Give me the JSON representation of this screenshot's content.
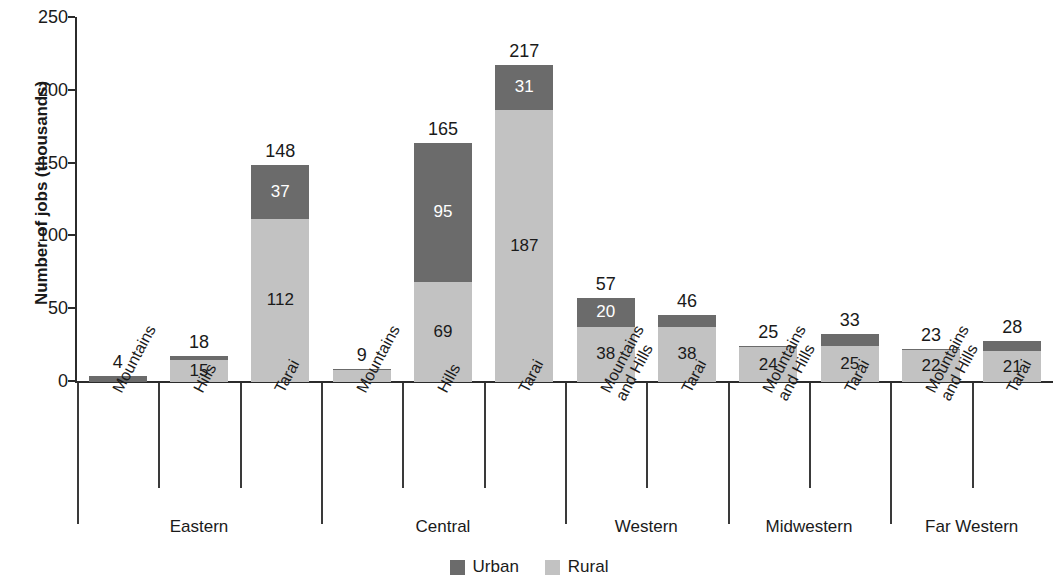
{
  "chart_data": {
    "type": "bar",
    "subtype": "stacked-bar-grouped",
    "title": "",
    "xlabel": "",
    "ylabel": "Number of jobs (thousands)",
    "ylim": [
      0,
      250
    ],
    "yticks": [
      0,
      50,
      100,
      150,
      200,
      250
    ],
    "ytick_labels": [
      "0",
      "50",
      "100",
      "150",
      "200",
      "250"
    ],
    "grid": false,
    "legend_position": "bottom-center",
    "legend": [
      {
        "name": "Urban",
        "color": "#6b6b6b"
      },
      {
        "name": "Rural",
        "color": "#c2c2c2"
      }
    ],
    "series": [
      {
        "name": "Urban",
        "color": "#6b6b6b",
        "values": [
          4,
          3,
          37,
          1,
          95,
          31,
          20,
          8,
          1,
          8,
          1,
          7
        ]
      },
      {
        "name": "Rural",
        "color": "#c2c2c2",
        "values": [
          0,
          15,
          112,
          8,
          69,
          187,
          38,
          38,
          24,
          25,
          22,
          21
        ]
      }
    ],
    "groups": [
      {
        "label": "Eastern",
        "bars": [
          {
            "category": "Mountains",
            "lines": [
              "Mountains"
            ],
            "total": 4,
            "urban": 4,
            "rural": 0,
            "urban_label": "",
            "rural_label": ""
          },
          {
            "category": "Hills",
            "lines": [
              "Hills"
            ],
            "total": 18,
            "urban": 3,
            "rural": 15,
            "urban_label": "",
            "rural_label": "15"
          },
          {
            "category": "Tarai",
            "lines": [
              "Tarai"
            ],
            "total": 148,
            "urban": 37,
            "rural": 112,
            "urban_label": "37",
            "rural_label": "112"
          }
        ]
      },
      {
        "label": "Central",
        "bars": [
          {
            "category": "Mountains",
            "lines": [
              "Mountains"
            ],
            "total": 9,
            "urban": 1,
            "rural": 8,
            "urban_label": "",
            "rural_label": ""
          },
          {
            "category": "Hills",
            "lines": [
              "Hills"
            ],
            "total": 165,
            "urban": 95,
            "rural": 69,
            "urban_label": "95",
            "rural_label": "69"
          },
          {
            "category": "Tarai",
            "lines": [
              "Tarai"
            ],
            "total": 217,
            "urban": 31,
            "rural": 187,
            "urban_label": "31",
            "rural_label": "187"
          }
        ]
      },
      {
        "label": "Western",
        "bars": [
          {
            "category": "Mountains and Hills",
            "lines": [
              "Mountains",
              "and Hills"
            ],
            "total": 57,
            "urban": 20,
            "rural": 38,
            "urban_label": "20",
            "rural_label": "38"
          },
          {
            "category": "Tarai",
            "lines": [
              "Tarai"
            ],
            "total": 46,
            "urban": 8,
            "rural": 38,
            "urban_label": "",
            "rural_label": "38"
          }
        ]
      },
      {
        "label": "Midwestern",
        "bars": [
          {
            "category": "Mountains and Hills",
            "lines": [
              "Mountains",
              "and Hills"
            ],
            "total": 25,
            "urban": 1,
            "rural": 24,
            "urban_label": "",
            "rural_label": "24"
          },
          {
            "category": "Tarai",
            "lines": [
              "Tarai"
            ],
            "total": 33,
            "urban": 8,
            "rural": 25,
            "urban_label": "",
            "rural_label": "25"
          }
        ]
      },
      {
        "label": "Far Western",
        "bars": [
          {
            "category": "Mountains and Hills",
            "lines": [
              "Mountains",
              "and Hills"
            ],
            "total": 23,
            "urban": 1,
            "rural": 22,
            "urban_label": "",
            "rural_label": "22"
          },
          {
            "category": "Tarai",
            "lines": [
              "Tarai"
            ],
            "total": 28,
            "urban": 7,
            "rural": 21,
            "urban_label": "",
            "rural_label": "21"
          }
        ]
      }
    ]
  }
}
